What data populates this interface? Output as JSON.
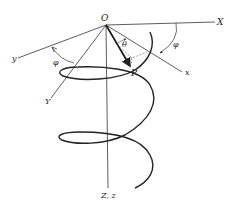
{
  "diagram": {
    "type": "helical trajectory in rotating coordinate frame",
    "labels": {
      "origin": "O",
      "fixed_x": "X",
      "fixed_y": "Y",
      "rotating_x": "x",
      "rotating_y": "y",
      "z_axis": "Z, z",
      "point": "P",
      "theta": "θ",
      "phi_left": "φ",
      "phi_right": "φ"
    },
    "colors": {
      "line": "#333333",
      "helix": "#222222",
      "dashed": "#555555",
      "background": "#ffffff"
    }
  }
}
